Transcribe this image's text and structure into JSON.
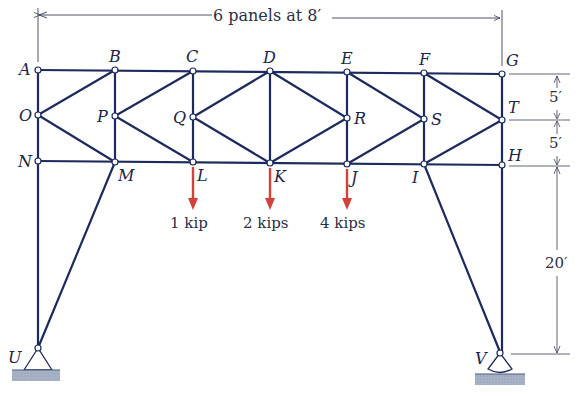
{
  "title_dimension": "6 panels at 8′",
  "dimensions": {
    "top_to_mid": "5′",
    "mid_to_bottom": "5′",
    "column_height": "20′"
  },
  "joints": {
    "A": "A",
    "B": "B",
    "C": "C",
    "D": "D",
    "E": "E",
    "F": "F",
    "G": "G",
    "O": "O",
    "P": "P",
    "Q": "Q",
    "R": "R",
    "S": "S",
    "T": "T",
    "N": "N",
    "M": "M",
    "L": "L",
    "K": "K",
    "J": "J",
    "I": "I",
    "H": "H",
    "U": "U",
    "V": "V"
  },
  "loads": [
    {
      "joint": "L",
      "label": "1 kip"
    },
    {
      "joint": "K",
      "label": "2 kips"
    },
    {
      "joint": "J",
      "label": "4 kips"
    }
  ],
  "supports": {
    "U": "pin",
    "V": "rocker"
  },
  "colors": {
    "member": "#1d2a5e",
    "load": "#d2413a",
    "dimension": "#3a3f55",
    "ground": "#9aa6bd"
  }
}
